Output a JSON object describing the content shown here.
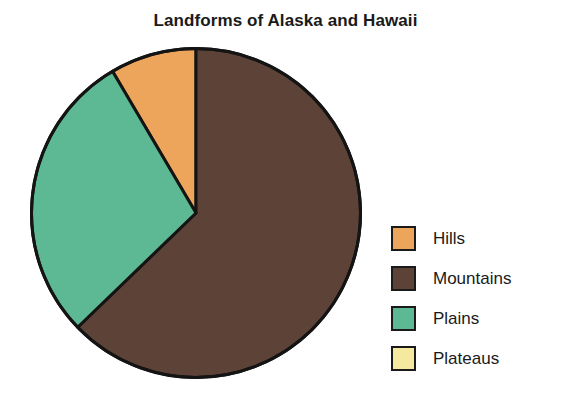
{
  "chart_data": {
    "type": "pie",
    "title": "Landforms of Alaska and Hawaii",
    "categories": [
      "Hills",
      "Mountains",
      "Plains",
      "Plateaus"
    ],
    "values": [
      8.5,
      62.8,
      28.7,
      0
    ],
    "unit": "percent",
    "start_angle_deg": 0,
    "direction": "clockwise",
    "legend_position": "right",
    "grid": false,
    "xlabel": "",
    "ylabel": "",
    "slices": [
      {
        "label": "Hills",
        "value": 8.5,
        "color": "#EDA55C",
        "start_deg": 329.5,
        "end_deg": 360.0
      },
      {
        "label": "Mountains",
        "value": 62.8,
        "color": "#5C4237",
        "start_deg": 0.0,
        "end_deg": 226.0
      },
      {
        "label": "Plains",
        "value": 28.7,
        "color": "#5DB894",
        "start_deg": 226.0,
        "end_deg": 329.5
      },
      {
        "label": "Plateaus",
        "value": 0,
        "color": "#F5E9A0",
        "start_deg": 360.0,
        "end_deg": 360.0
      }
    ],
    "outline_color": "#141414",
    "outline_width": 3
  },
  "legend": {
    "items": [
      {
        "label": "Hills",
        "color": "#EDA55C"
      },
      {
        "label": "Mountains",
        "color": "#5C4237"
      },
      {
        "label": "Plains",
        "color": "#5DB894"
      },
      {
        "label": "Plateaus",
        "color": "#F5E9A0"
      }
    ]
  }
}
